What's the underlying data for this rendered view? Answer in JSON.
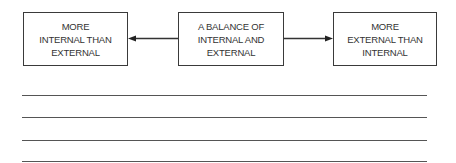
{
  "diagram": {
    "boxes": [
      {
        "lines": [
          "MORE",
          "INTERNAL THAN",
          "EXTERNAL"
        ]
      },
      {
        "lines": [
          "A BALANCE OF",
          "INTERNAL AND",
          "EXTERNAL"
        ]
      },
      {
        "lines": [
          "MORE",
          "EXTERNAL THAN",
          "INTERNAL"
        ]
      }
    ],
    "arrows": [
      {
        "from": "center",
        "to": "left"
      },
      {
        "from": "center",
        "to": "right"
      }
    ],
    "answer_lines": 4
  }
}
